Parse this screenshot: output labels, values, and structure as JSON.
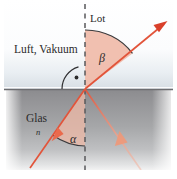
{
  "figure": {
    "width": 177,
    "height": 179
  },
  "labels": {
    "upper_medium": "Luft, Vakuum",
    "normal": "Lot",
    "lower_medium": "Glas",
    "refractive_index": "n",
    "angle_upper": "β",
    "angle_lower": "α"
  },
  "colors": {
    "ray": "#e2543a",
    "ray_light": "#ef9e86",
    "wedge_fill": "#f0bba9",
    "wedge_stroke": "#d9775c",
    "glass_top": "#8e8e90",
    "glass_bottom": "#d8d9da",
    "air_top": "#ffffff",
    "air_bottom": "#dfe5ea",
    "interface": "#6f6f72",
    "normal_dash": "#5a5a5d",
    "text": "#2b2b2b"
  },
  "geometry": {
    "interface_y": 89,
    "normal_x": 85,
    "origin": {
      "x": 85,
      "y": 89
    },
    "glass_left": 6,
    "glass_right": 171,
    "glass_bottom": 173
  },
  "elements": {
    "incident_ray": "incident-ray-arrow",
    "refracted_ray": "refracted-ray-arrow",
    "reflected_ray": "reflected-ray-arrow",
    "right_angle_marker": "right-angle-arc-dot"
  }
}
